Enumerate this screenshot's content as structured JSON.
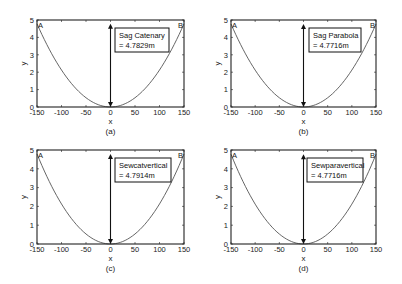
{
  "chart_data": [
    {
      "type": "line",
      "panel_label": "(a)",
      "xlabel": "x",
      "ylabel": "y",
      "xlim": [
        -150,
        150
      ],
      "ylim": [
        0,
        5
      ],
      "xticks": [
        -150,
        -100,
        -50,
        0,
        50,
        100,
        150
      ],
      "yticks": [
        0,
        1,
        2,
        3,
        4,
        5
      ],
      "points": {
        "A": "A",
        "B": "B"
      },
      "annotation": {
        "line1": "Sag Catenary",
        "line2": "= 4.7829m"
      },
      "sag": 4.7829,
      "series": [
        {
          "name": "catenary",
          "x": [
            -150,
            -100,
            -50,
            0,
            50,
            100,
            150
          ],
          "y": [
            4.78,
            2.12,
            0.53,
            0,
            0.53,
            2.12,
            4.78
          ]
        }
      ]
    },
    {
      "type": "line",
      "panel_label": "(b)",
      "xlabel": "x",
      "ylabel": "y",
      "xlim": [
        -150,
        150
      ],
      "ylim": [
        0,
        5
      ],
      "xticks": [
        -150,
        -100,
        -50,
        0,
        50,
        100,
        150
      ],
      "yticks": [
        0,
        1,
        2,
        3,
        4,
        5
      ],
      "points": {
        "A": "A",
        "B": "B"
      },
      "annotation": {
        "line1": "Sag Parabola",
        "line2": "= 4.7716m"
      },
      "sag": 4.7716,
      "series": [
        {
          "name": "parabola",
          "x": [
            -150,
            -100,
            -50,
            0,
            50,
            100,
            150
          ],
          "y": [
            4.77,
            2.12,
            0.53,
            0,
            0.53,
            2.12,
            4.77
          ]
        }
      ]
    },
    {
      "type": "line",
      "panel_label": "(c)",
      "xlabel": "x",
      "ylabel": "y",
      "xlim": [
        -150,
        150
      ],
      "ylim": [
        0,
        5
      ],
      "xticks": [
        -150,
        -100,
        -50,
        0,
        50,
        100,
        150
      ],
      "yticks": [
        0,
        1,
        2,
        3,
        4,
        5
      ],
      "points": {
        "A": "A",
        "B": "B"
      },
      "annotation": {
        "line1": "Sewcatvertical",
        "line2": "= 4.7914m"
      },
      "sag": 4.7914,
      "series": [
        {
          "name": "catenary vertical",
          "x": [
            -150,
            -100,
            -50,
            0,
            50,
            100,
            150
          ],
          "y": [
            4.79,
            2.13,
            0.53,
            0,
            0.53,
            2.13,
            4.79
          ]
        }
      ]
    },
    {
      "type": "line",
      "panel_label": "(d)",
      "xlabel": "x",
      "ylabel": "y",
      "xlim": [
        -150,
        150
      ],
      "ylim": [
        0,
        5
      ],
      "xticks": [
        -150,
        -100,
        -50,
        0,
        50,
        100,
        150
      ],
      "yticks": [
        0,
        1,
        2,
        3,
        4,
        5
      ],
      "points": {
        "A": "A",
        "B": "B"
      },
      "annotation": {
        "line1": "Sewparavertical",
        "line2": "= 4.7716m"
      },
      "sag": 4.7716,
      "series": [
        {
          "name": "parabola vertical",
          "x": [
            -150,
            -100,
            -50,
            0,
            50,
            100,
            150
          ],
          "y": [
            4.77,
            2.12,
            0.53,
            0,
            0.53,
            2.12,
            4.77
          ]
        }
      ]
    }
  ],
  "colors": {
    "axis": "#222222",
    "curve": "#555555",
    "arrow": "#111111"
  }
}
